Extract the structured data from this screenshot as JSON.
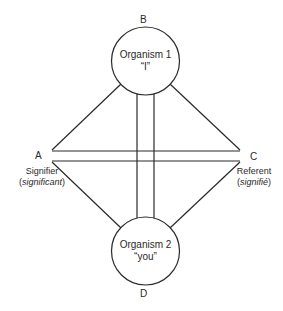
{
  "diagram": {
    "colors": {
      "stroke": "#2a2a2a",
      "background": "#ffffff",
      "text": "#2a2a2a"
    },
    "nodes": {
      "top": {
        "vertex": "B",
        "line1": "Organism 1",
        "line2": "“I”"
      },
      "bottom": {
        "vertex": "D",
        "line1": "Organism 2",
        "line2": "“you”"
      },
      "left": {
        "vertex": "A",
        "label": "Signifier",
        "sublabel_open": "(",
        "sublabel": "significant",
        "sublabel_close": ")"
      },
      "right": {
        "vertex": "C",
        "label": "Referent",
        "sublabel_open": "(",
        "sublabel": "signifié",
        "sublabel_close": ")"
      }
    },
    "edges": [
      {
        "from": "B",
        "to": "A",
        "type": "single"
      },
      {
        "from": "B",
        "to": "C",
        "type": "single"
      },
      {
        "from": "D",
        "to": "A",
        "type": "single"
      },
      {
        "from": "D",
        "to": "C",
        "type": "single"
      },
      {
        "from": "A",
        "to": "C",
        "type": "double"
      },
      {
        "from": "B",
        "to": "D",
        "type": "double"
      }
    ]
  }
}
